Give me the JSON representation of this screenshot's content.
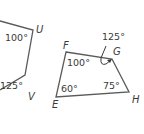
{
  "figures": [
    {
      "name": "left-polygon",
      "vertices": [
        {
          "label": "U"
        },
        {
          "label": "V"
        }
      ],
      "angles": [
        {
          "at": "U",
          "value": "100°"
        },
        {
          "at": "V",
          "value": "125°"
        }
      ]
    },
    {
      "name": "quadrilateral-EFGH",
      "vertices": [
        {
          "label": "F"
        },
        {
          "label": "G"
        },
        {
          "label": "H"
        },
        {
          "label": "E"
        }
      ],
      "angles": [
        {
          "at": "F",
          "value": "100°"
        },
        {
          "at": "G",
          "value": "125°",
          "note": "exterior"
        },
        {
          "at": "H",
          "value": "75°"
        },
        {
          "at": "E",
          "value": "60°"
        }
      ]
    }
  ],
  "colors": {
    "stroke": "#5a5a5a",
    "text": "#3a3a3a"
  }
}
